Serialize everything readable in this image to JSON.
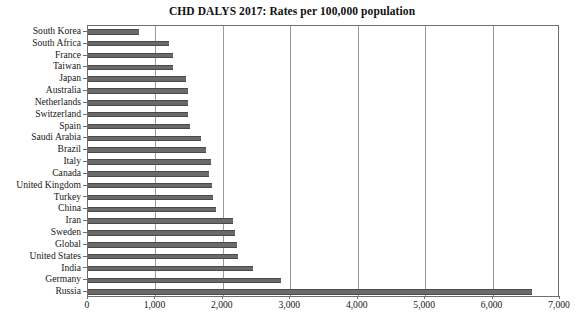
{
  "chart_data": {
    "type": "bar",
    "orientation": "horizontal",
    "title": "CHD DALYS 2017: Rates per 100,000 population",
    "xlabel": "",
    "ylabel": "",
    "xlim": [
      0,
      7000
    ],
    "ylim": null,
    "grid": "vertical",
    "legend": null,
    "xticks": [
      "0",
      "1,000",
      "2,000",
      "3,000",
      "4,000",
      "5,000",
      "6,000",
      "7,000"
    ],
    "xtick_values": [
      0,
      1000,
      2000,
      3000,
      4000,
      5000,
      6000,
      7000
    ],
    "bar_color": "#6a6a6a",
    "categories": [
      "South Korea",
      "South Africa",
      "France",
      "Taiwan",
      "Japan",
      "Australia",
      "Netherlands",
      "Switzerland",
      "Spain",
      "Saudi Arabia",
      "Brazil",
      "Italy",
      "Canada",
      "United Kingdom",
      "Turkey",
      "China",
      "Iran",
      "Sweden",
      "Global",
      "United States",
      "India",
      "Germany",
      "Russia"
    ],
    "values": [
      760,
      1200,
      1260,
      1260,
      1450,
      1480,
      1480,
      1490,
      1510,
      1680,
      1750,
      1830,
      1800,
      1840,
      1860,
      1900,
      2150,
      2180,
      2210,
      2230,
      2450,
      2860,
      6590
    ]
  }
}
